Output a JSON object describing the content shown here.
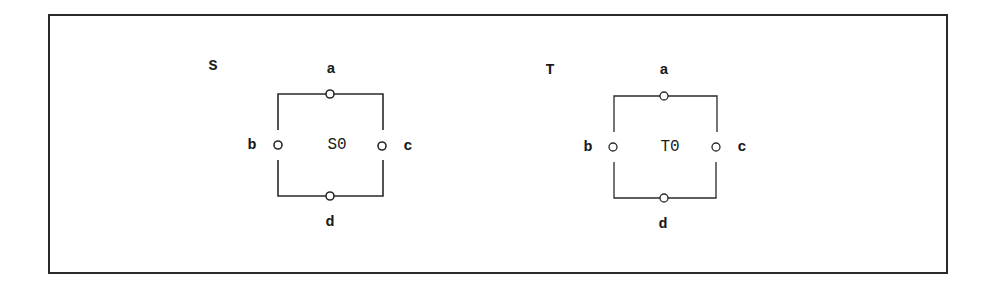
{
  "figure": {
    "border_color": "#2a2a2a",
    "line_color": "#2a2a2a"
  },
  "components": [
    {
      "name": "S",
      "instance": "S0",
      "ports": {
        "top": "a",
        "left": "b",
        "right": "c",
        "bottom": "d"
      }
    },
    {
      "name": "T",
      "instance": "T0",
      "ports": {
        "top": "a",
        "left": "b",
        "right": "c",
        "bottom": "d"
      }
    }
  ]
}
